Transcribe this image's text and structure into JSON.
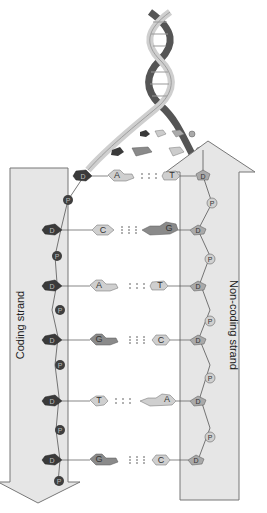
{
  "labels": {
    "coding_strand": "Coding strand",
    "noncoding_strand": "Non-coding strand",
    "sugar": "D",
    "phosphate": "P"
  },
  "colors": {
    "arrow_fill": "#e6e6e6",
    "arrow_stroke": "#777777",
    "coding_sugar": "#3a3a3a",
    "coding_phosphate": "#3f3f3f",
    "noncoding_sugar": "#a9a9a9",
    "noncoding_phosphate": "#c8c8c8",
    "light_base": "#cfcfcf",
    "dark_base": "#8a8a8a",
    "helix_light": "#cfcfcf",
    "helix_dark": "#555555"
  },
  "strands": {
    "coding": {
      "label": "Coding strand",
      "direction": "down"
    },
    "noncoding": {
      "label": "Non-coding strand",
      "direction": "up"
    }
  },
  "base_pairs": [
    {
      "coding": "A",
      "noncoding": "T",
      "hbonds": 2
    },
    {
      "coding": "C",
      "noncoding": "G",
      "hbonds": 3
    },
    {
      "coding": "A",
      "noncoding": "T",
      "hbonds": 2
    },
    {
      "coding": "G",
      "noncoding": "C",
      "hbonds": 3
    },
    {
      "coding": "T",
      "noncoding": "A",
      "hbonds": 2
    },
    {
      "coding": "G",
      "noncoding": "C",
      "hbonds": 3
    }
  ]
}
